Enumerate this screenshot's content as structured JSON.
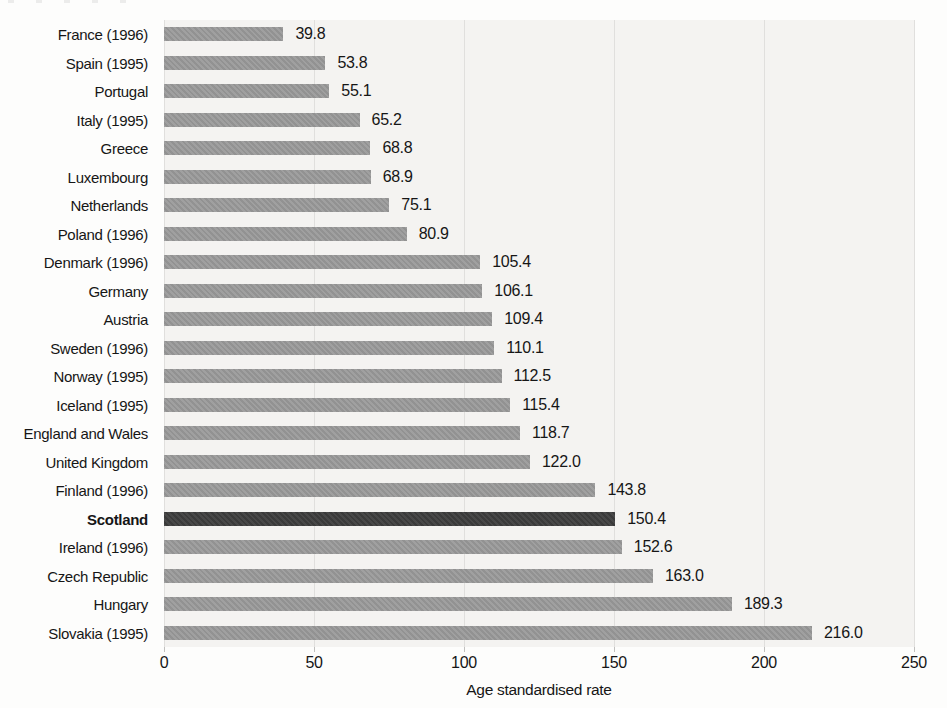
{
  "chart_data": {
    "type": "bar",
    "orientation": "horizontal",
    "title": "",
    "xlabel": "Age standardised rate",
    "ylabel": "",
    "xlim": [
      0,
      250
    ],
    "x_ticks": [
      0,
      50,
      100,
      150,
      200,
      250
    ],
    "grid": "vertical-on",
    "legend": "none",
    "categories": [
      "France (1996)",
      "Spain (1995)",
      "Portugal",
      "Italy (1995)",
      "Greece",
      "Luxembourg",
      "Netherlands",
      "Poland (1996)",
      "Denmark (1996)",
      "Germany",
      "Austria",
      "Sweden (1996)",
      "Norway (1995)",
      "Iceland (1995)",
      "England and Wales",
      "United Kingdom",
      "Finland (1996)",
      "Scotland",
      "Ireland (1996)",
      "Czech Republic",
      "Hungary",
      "Slovakia (1995)"
    ],
    "values": [
      39.8,
      53.8,
      55.1,
      65.2,
      68.8,
      68.9,
      75.1,
      80.9,
      105.4,
      106.1,
      109.4,
      110.1,
      112.5,
      115.4,
      118.7,
      122.0,
      143.8,
      150.4,
      152.6,
      163.0,
      189.3,
      216.0
    ],
    "value_labels": [
      "39.8",
      "53.8",
      "55.1",
      "65.2",
      "68.8",
      "68.9",
      "75.1",
      "80.9",
      "105.4",
      "106.1",
      "109.4",
      "110.1",
      "112.5",
      "115.4",
      "118.7",
      "122.0",
      "143.8",
      "150.4",
      "152.6",
      "163.0",
      "189.3",
      "216.0"
    ],
    "highlight_category": "Scotland",
    "colors": {
      "bar": "#9a9a9a",
      "highlight_bar": "#3d3d3d",
      "panel_background": "#f4f3f1",
      "gridline": "#e0dfdd",
      "text": "#161616"
    }
  }
}
